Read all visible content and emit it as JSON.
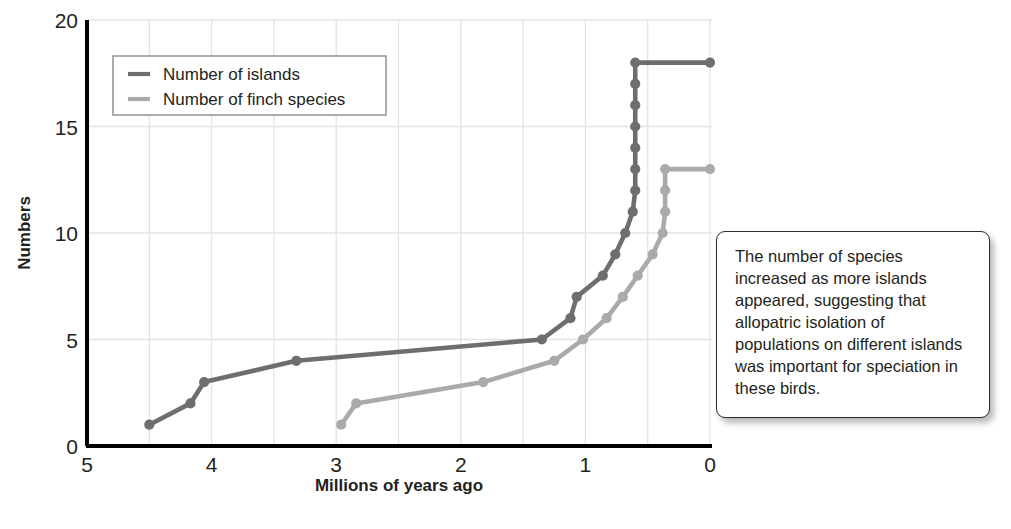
{
  "chart_data": {
    "type": "line",
    "title": "",
    "xlabel": "Millions of years ago",
    "ylabel": "Numbers",
    "xlim": [
      5,
      0
    ],
    "ylim": [
      0,
      20
    ],
    "x_reversed": true,
    "grid": true,
    "x_ticks": [
      "5",
      "4",
      "3",
      "2",
      "1",
      "0"
    ],
    "x_tick_values": [
      5,
      4,
      3,
      2,
      1,
      0
    ],
    "y_ticks": [
      "0",
      "5",
      "10",
      "15",
      "20"
    ],
    "y_tick_values": [
      0,
      5,
      10,
      15,
      20
    ],
    "x_minor_step": 0.5,
    "legend_position": "top-left",
    "series": [
      {
        "name": "Number of islands",
        "color": "#6e6e6e",
        "points": [
          [
            4.5,
            1
          ],
          [
            4.17,
            2
          ],
          [
            4.06,
            3
          ],
          [
            3.32,
            4
          ],
          [
            1.35,
            5
          ],
          [
            1.12,
            6
          ],
          [
            1.07,
            7
          ],
          [
            0.86,
            8
          ],
          [
            0.76,
            9
          ],
          [
            0.68,
            10
          ],
          [
            0.62,
            11
          ],
          [
            0.6,
            12
          ],
          [
            0.6,
            13
          ],
          [
            0.6,
            14
          ],
          [
            0.6,
            15
          ],
          [
            0.6,
            16
          ],
          [
            0.6,
            17
          ],
          [
            0.6,
            18
          ],
          [
            0.0,
            18
          ]
        ]
      },
      {
        "name": "Number of finch species",
        "color": "#aaaaaa",
        "points": [
          [
            2.96,
            1
          ],
          [
            2.84,
            2
          ],
          [
            1.82,
            3
          ],
          [
            1.25,
            4
          ],
          [
            1.02,
            5
          ],
          [
            0.83,
            6
          ],
          [
            0.7,
            7
          ],
          [
            0.58,
            8
          ],
          [
            0.46,
            9
          ],
          [
            0.38,
            10
          ],
          [
            0.36,
            11
          ],
          [
            0.36,
            12
          ],
          [
            0.36,
            13
          ],
          [
            0.0,
            13
          ]
        ]
      }
    ]
  },
  "legend": {
    "items": [
      {
        "label": "Number of islands",
        "color": "#6e6e6e"
      },
      {
        "label": "Number of finch species",
        "color": "#aaaaaa"
      }
    ]
  },
  "callout": {
    "text": "The number of species increased as more islands appeared, suggesting that allopatric isolation of populations on different islands was important for speciation in these birds."
  }
}
